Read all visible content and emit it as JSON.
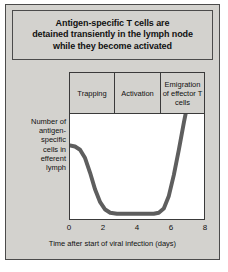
{
  "figure": {
    "title": "Antigen-specific T cells are detained transiently in the lymph node while they become activated",
    "title_lines": [
      "Antigen-specific T cells are",
      "detained transiently in the lymph node",
      "while they become activated"
    ],
    "panel_color": "#d3d2ce",
    "border_color": "#4b4b4b",
    "plot_background": "#ffffff",
    "curve_color": "#5e5e5e"
  },
  "ylabel_lines": [
    "Number of",
    "antigen-",
    "specific",
    "cells in",
    "efferent",
    "lymph"
  ],
  "phases": [
    {
      "label": "Trapping",
      "start_day": 0,
      "end_day": 2.6
    },
    {
      "label": "Activation",
      "start_day": 2.6,
      "end_day": 5.3
    },
    {
      "label": "Emigration of effector T cells",
      "start_day": 5.3,
      "end_day": 8
    }
  ],
  "chart_data": {
    "type": "line",
    "title": "Antigen-specific T cells are detained transiently in the lymph node while they become activated",
    "xlabel": "Time after start of viral infection (days)",
    "ylabel": "Number of antigen-specific cells in efferent lymph",
    "xlim": [
      0,
      8
    ],
    "ylim": [
      0,
      1
    ],
    "xticks": [
      0,
      2,
      4,
      6,
      8
    ],
    "xtick_labels": [
      "0",
      "2",
      "4",
      "6",
      "8"
    ],
    "yticks": [],
    "ytick_labels": [],
    "grid": false,
    "legend": false,
    "series": [
      {
        "name": "Antigen-specific cells in efferent lymph",
        "color": "#5e5e5e",
        "x": [
          0.0,
          0.3,
          0.6,
          0.9,
          1.2,
          1.5,
          1.8,
          2.1,
          2.4,
          2.8,
          3.4,
          4.0,
          4.6,
          5.0,
          5.3,
          5.6,
          5.9,
          6.2,
          6.5,
          6.8,
          6.9
        ],
        "values": [
          0.7,
          0.69,
          0.66,
          0.58,
          0.44,
          0.28,
          0.16,
          0.09,
          0.06,
          0.05,
          0.05,
          0.05,
          0.05,
          0.05,
          0.06,
          0.1,
          0.22,
          0.42,
          0.66,
          0.92,
          1.0
        ]
      }
    ],
    "annotations": [
      {
        "text": "Trapping",
        "x_range": [
          0,
          2.6
        ],
        "position": "above-plot"
      },
      {
        "text": "Activation",
        "x_range": [
          2.6,
          5.3
        ],
        "position": "above-plot"
      },
      {
        "text": "Emigration of effector T cells",
        "x_range": [
          5.3,
          8
        ],
        "position": "above-plot"
      }
    ]
  }
}
